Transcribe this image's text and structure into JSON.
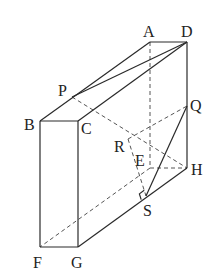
{
  "diagram": {
    "type": "3d-rectangular-prism",
    "stroke_color": "#2a2a2a",
    "dash_color": "#555555",
    "vertices": {
      "A": {
        "label": "A",
        "x": 150,
        "y": 42
      },
      "D": {
        "label": "D",
        "x": 187,
        "y": 42
      },
      "B": {
        "label": "B",
        "x": 40,
        "y": 121
      },
      "C": {
        "label": "C",
        "x": 78,
        "y": 121
      },
      "F": {
        "label": "F",
        "x": 40,
        "y": 247
      },
      "G": {
        "label": "G",
        "x": 78,
        "y": 247
      },
      "H": {
        "label": "H",
        "x": 187,
        "y": 168
      },
      "E": {
        "label": "E",
        "x": 150,
        "y": 168
      },
      "P": {
        "label": "P",
        "x": 72,
        "y": 97
      },
      "Q": {
        "label": "Q",
        "x": 187,
        "y": 106
      },
      "R": {
        "label": "R",
        "x": 128,
        "y": 139
      },
      "S": {
        "label": "S",
        "x": 146,
        "y": 196
      }
    },
    "solid_edges": [
      [
        "A",
        "D"
      ],
      [
        "A",
        "B"
      ],
      [
        "D",
        "C"
      ],
      [
        "B",
        "C"
      ],
      [
        "B",
        "F"
      ],
      [
        "C",
        "G"
      ],
      [
        "F",
        "G"
      ],
      [
        "G",
        "H"
      ],
      [
        "D",
        "H"
      ],
      [
        "D",
        "P"
      ],
      [
        "Q",
        "S"
      ]
    ],
    "dashed_edges": [
      [
        "A",
        "E"
      ],
      [
        "E",
        "F"
      ],
      [
        "E",
        "H"
      ],
      [
        "P",
        "H"
      ],
      [
        "R",
        "Q"
      ],
      [
        "R",
        "S"
      ]
    ],
    "right_angle_at": "S"
  }
}
